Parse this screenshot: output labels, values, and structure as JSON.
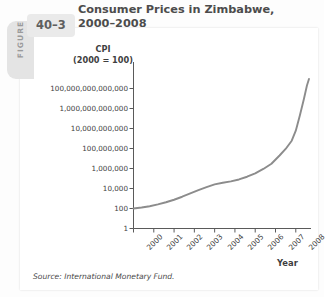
{
  "figure": {
    "tab_word": "FIGURE",
    "number": "40–3"
  },
  "title": "Consumer Prices in Zimbabwe, 2000–2008",
  "source": "Source: International Monetary Fund.",
  "colors": {
    "line": "#8c8c8c",
    "axis": "#5a5a5a",
    "text": "#3f3f3f",
    "title_text": "#4c4c4c",
    "tab_gray": "#e4e4e4",
    "card": "#ffffff",
    "page_bg": "#fdfdfd"
  },
  "chart_data": {
    "type": "line",
    "title": "Consumer Prices in Zimbabwe, 2000–2008",
    "xlabel": "Year",
    "ylabel": "CPI (2000 = 100)",
    "ylabel_line1": "CPI",
    "ylabel_line2": "(2000 = 100)",
    "yscale": "log",
    "ylim": [
      1,
      1000000000000000
    ],
    "grid": false,
    "legend": "none",
    "ytick_labels": [
      "100,000,000,000,000",
      "1,000,000,000,000",
      "10,000,000,000",
      "100,000,000",
      "1,000,000",
      "10,000",
      "100",
      "1"
    ],
    "ytick_values": [
      100000000000000.0,
      1000000000000.0,
      10000000000.0,
      100000000.0,
      1000000.0,
      10000.0,
      100.0,
      1
    ],
    "xtick_labels": [
      "2000",
      "2001",
      "2002",
      "2003",
      "2004",
      "2005",
      "2006",
      "2007",
      "2008"
    ],
    "xlim": [
      2000,
      2008.75
    ],
    "series": [
      {
        "name": "Zimbabwe CPI (2000 = 100)",
        "x": [
          2000.0,
          2000.4,
          2000.8,
          2001.2,
          2001.6,
          2002.0,
          2002.4,
          2002.8,
          2003.2,
          2003.6,
          2004.0,
          2004.4,
          2004.8,
          2005.2,
          2005.6,
          2006.0,
          2006.4,
          2006.8,
          2007.2,
          2007.5,
          2007.8,
          2008.0,
          2008.2,
          2008.4,
          2008.55,
          2008.65
        ],
        "y": [
          100,
          125,
          170,
          260,
          420,
          750,
          1500,
          3200,
          7000,
          14000,
          26000,
          38000,
          52000,
          80000,
          150000,
          330000,
          900000,
          3000000,
          20000000,
          90000000,
          600000000,
          6000000000,
          200000000000,
          9000000000000,
          200000000000000,
          900000000000000
        ]
      }
    ]
  }
}
